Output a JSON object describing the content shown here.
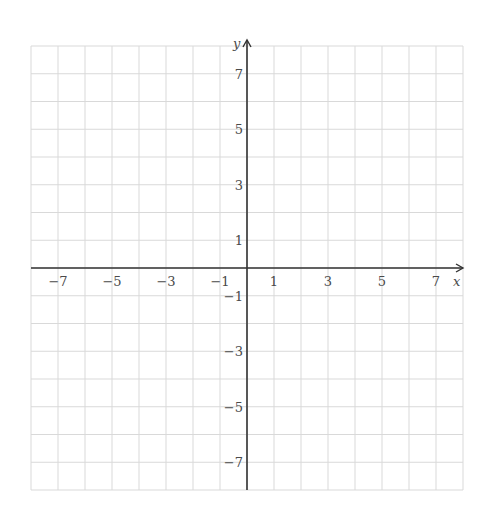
{
  "chart_data": {
    "type": "coordinate-grid",
    "title": "",
    "xlabel": "x",
    "ylabel": "y",
    "xlim": [
      -8,
      8
    ],
    "ylim": [
      -8,
      8
    ],
    "grid": true,
    "grid_step": 1,
    "x_ticks": [
      -7,
      -5,
      -3,
      -1,
      1,
      3,
      5,
      7
    ],
    "x_tick_labels": [
      "−7",
      "−5",
      "−3",
      "−1",
      "1",
      "3",
      "5",
      "7"
    ],
    "y_ticks": [
      7,
      5,
      3,
      1,
      -1,
      -3,
      -5,
      -7
    ],
    "y_tick_labels": [
      "7",
      "5",
      "3",
      "1",
      "−1",
      "−3",
      "−5",
      "−7"
    ],
    "series": []
  },
  "colors": {
    "grid": "#d9d9d9",
    "axis": "#333333",
    "label": "#4a4a4a",
    "background": "#ffffff"
  },
  "layout": {
    "left": 31,
    "right": 463,
    "top": 46,
    "bottom": 490,
    "origin_x": 247,
    "origin_y": 268
  }
}
